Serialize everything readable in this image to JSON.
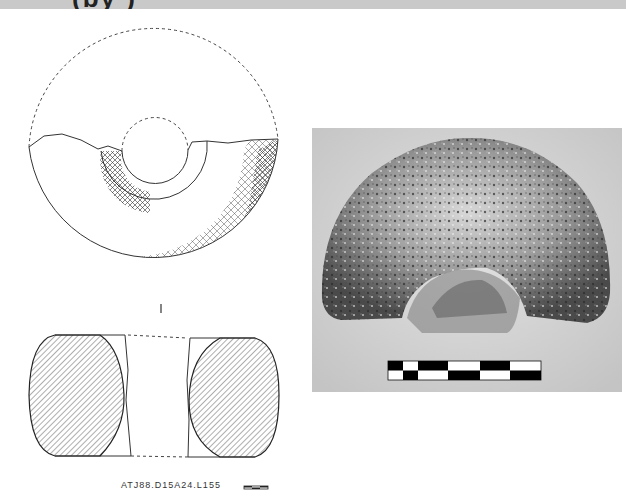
{
  "header": {
    "clipped_title": "(by        )"
  },
  "figure": {
    "plan_view": {
      "name": "ring-object-plan-drawing",
      "outer_radius": 125,
      "inner_radius": 33,
      "ring_radius": 53,
      "hatch_color": "#333333"
    },
    "section_view": {
      "name": "ring-object-section-drawing",
      "hatch": "diagonal"
    },
    "section_marker": "I",
    "catalog_label": "ATJ88.D15A24.L155",
    "small_scale_bar": {
      "segments": 3
    },
    "photo": {
      "description": "photograph of porous stone ring fragment",
      "background": "#d6d6d6",
      "object_dark": "#3a3a3a",
      "object_light": "#cfcfcf"
    },
    "photo_scale_bar": {
      "segments": 6,
      "colors": [
        "#000000",
        "#ffffff"
      ]
    }
  }
}
